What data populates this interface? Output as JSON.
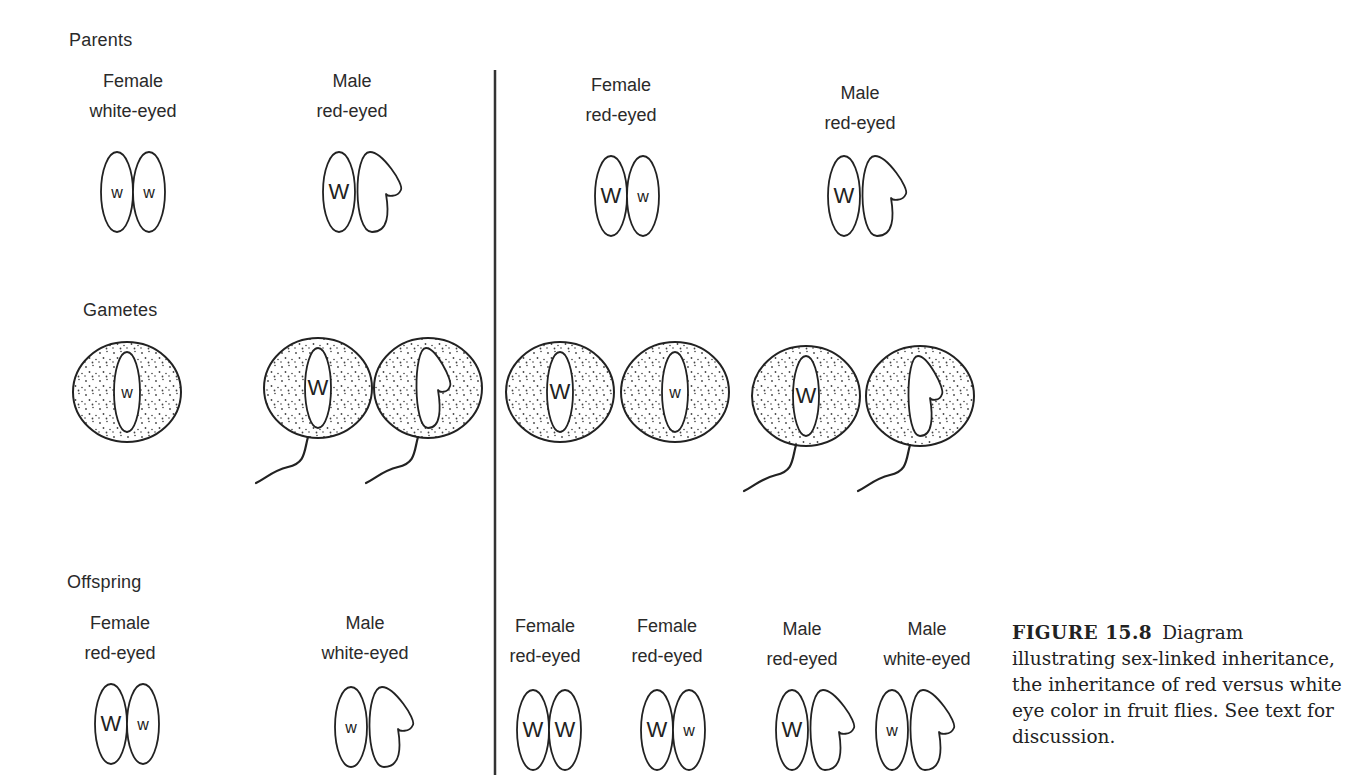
{
  "sections": {
    "parents": "Parents",
    "gametes": "Gametes",
    "offspring": "Offspring"
  },
  "divider": {
    "x": 495,
    "y1": 70,
    "y2": 775,
    "color": "#333333"
  },
  "parents": [
    {
      "sex": "Female",
      "phenotype": "white-eyed",
      "label_x": 133,
      "chrom_x": 133,
      "genotype": [
        "w",
        "w"
      ],
      "type": "XX"
    },
    {
      "sex": "Male",
      "phenotype": "red-eyed",
      "label_x": 352,
      "chrom_x": 355,
      "genotype": [
        "W",
        "Y"
      ],
      "type": "XY"
    },
    {
      "sex": "Female",
      "phenotype": "red-eyed",
      "label_x": 621,
      "chrom_x": 627,
      "genotype": [
        "W",
        "w"
      ],
      "type": "XX"
    },
    {
      "sex": "Male",
      "phenotype": "red-eyed",
      "label_x": 860,
      "chrom_x": 860,
      "genotype": [
        "W",
        "Y"
      ],
      "type": "XY"
    }
  ],
  "gametes": [
    {
      "kind": "egg",
      "cx": 127,
      "allele": "w",
      "chrom": "X"
    },
    {
      "kind": "sperm",
      "cx": 318,
      "allele": "W",
      "chrom": "X"
    },
    {
      "kind": "sperm",
      "cx": 428,
      "allele": "",
      "chrom": "Y"
    },
    {
      "kind": "egg",
      "cx": 560,
      "allele": "W",
      "chrom": "X"
    },
    {
      "kind": "egg",
      "cx": 675,
      "allele": "w",
      "chrom": "X"
    },
    {
      "kind": "sperm",
      "cx": 806,
      "allele": "W",
      "chrom": "X"
    },
    {
      "kind": "sperm",
      "cx": 920,
      "allele": "",
      "chrom": "Y"
    }
  ],
  "offspring": [
    {
      "sex": "Female",
      "phenotype": "red-eyed",
      "label_x": 120,
      "chrom_x": 127,
      "genotype": [
        "W",
        "w"
      ],
      "type": "XX"
    },
    {
      "sex": "Male",
      "phenotype": "white-eyed",
      "label_x": 365,
      "chrom_x": 367,
      "genotype": [
        "w",
        "Y"
      ],
      "type": "XY"
    },
    {
      "sex": "Female",
      "phenotype": "red-eyed",
      "label_x": 544,
      "chrom_x": 549,
      "genotype": [
        "W",
        "W"
      ],
      "type": "XX"
    },
    {
      "sex": "Female",
      "phenotype": "red-eyed",
      "label_x": 667,
      "chrom_x": 673,
      "genotype": [
        "W",
        "w"
      ],
      "type": "XX"
    },
    {
      "sex": "Male",
      "phenotype": "red-eyed",
      "label_x": 802,
      "chrom_x": 808,
      "genotype": [
        "W",
        "Y"
      ],
      "type": "XY"
    },
    {
      "sex": "Male",
      "phenotype": "white-eyed",
      "label_x": 927,
      "chrom_x": 908,
      "genotype": [
        "w",
        "Y"
      ],
      "type": "XY"
    }
  ],
  "caption": {
    "figure_number": "FIGURE 15.8",
    "text": "Diagram illustrating sex-linked inheritance, the inheritance of red versus white eye color in fruit flies. See text for discussion."
  }
}
